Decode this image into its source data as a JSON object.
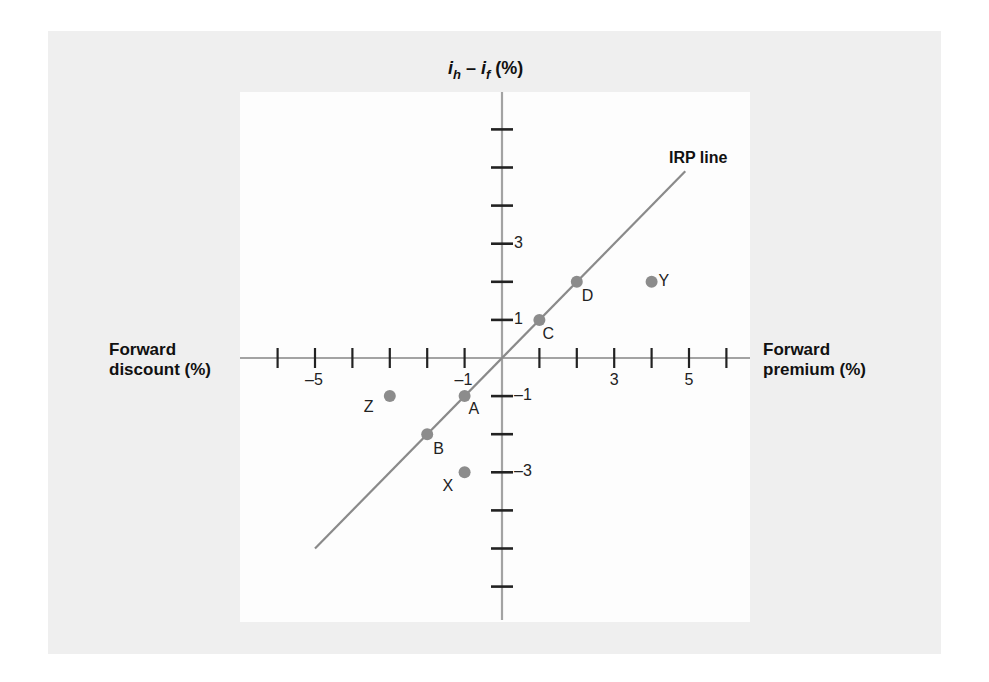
{
  "chart_data": {
    "type": "scatter",
    "title": "",
    "ylabel": "i_h − i_f (%)",
    "ylabel_parts": {
      "base1": "i",
      "sub1": "h",
      "mid": " – ",
      "base2": "i",
      "sub2": "f",
      "tail": " (%)"
    },
    "xlabel_left": [
      "Forward",
      "discount (%)"
    ],
    "xlabel_right": [
      "Forward",
      "premium (%)"
    ],
    "xlim": [
      -6,
      6
    ],
    "ylim": [
      -6,
      6
    ],
    "x_tick_positions": [
      -6,
      -5,
      -4,
      -3,
      -2,
      -1,
      1,
      2,
      3,
      4,
      5,
      6
    ],
    "x_tick_labels": [
      {
        "value": -5,
        "label": "–5"
      },
      {
        "value": -1,
        "label": "–1"
      },
      {
        "value": 3,
        "label": "3"
      },
      {
        "value": 5,
        "label": "5"
      }
    ],
    "y_tick_positions": [
      6,
      5,
      4,
      3,
      2,
      1,
      -1,
      -2,
      -3,
      -4,
      -5,
      -6
    ],
    "y_tick_labels": [
      {
        "value": 3,
        "label": "3"
      },
      {
        "value": 1,
        "label": "1"
      },
      {
        "value": -1,
        "label": "–1"
      },
      {
        "value": -3,
        "label": "–3"
      }
    ],
    "grid": false,
    "legend": null,
    "series": [
      {
        "name": "IRP line",
        "type": "line",
        "x": [
          -5,
          4.9
        ],
        "y": [
          -5,
          4.9
        ]
      },
      {
        "name": "Points",
        "type": "scatter",
        "points": [
          {
            "label": "A",
            "x": -1,
            "y": -1
          },
          {
            "label": "B",
            "x": -2,
            "y": -2
          },
          {
            "label": "C",
            "x": 1,
            "y": 1
          },
          {
            "label": "D",
            "x": 2,
            "y": 2
          },
          {
            "label": "X",
            "x": -1,
            "y": -3
          },
          {
            "label": "Y",
            "x": 4,
            "y": 2
          },
          {
            "label": "Z",
            "x": -3,
            "y": -1
          }
        ]
      }
    ],
    "annotations": [
      {
        "text": "IRP line",
        "x": 4.6,
        "y": 5.3
      }
    ],
    "colors": {
      "axis": "#a3a3a3",
      "line": "#8a8a8a",
      "points": "#8c8c8c",
      "ticks": "#222222",
      "panel_bg": "#efefef",
      "plot_bg": "#fdfdfd"
    }
  }
}
